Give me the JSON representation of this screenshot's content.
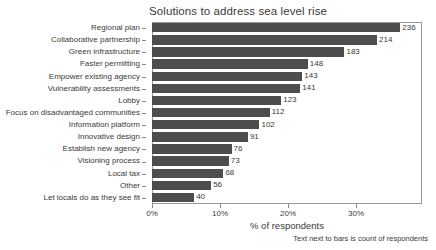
{
  "chart_data": {
    "type": "bar",
    "orientation": "horizontal",
    "title": "Solutions to address sea level rise",
    "xlabel": "% of respondents",
    "ylabel": "",
    "footnote": "Text next to bars is count of respondents",
    "xlim": [
      0,
      39.7
    ],
    "xticks": [
      0,
      10,
      20,
      30
    ],
    "xtick_labels": [
      "0%",
      "10%",
      "20%",
      "30%"
    ],
    "grid": false,
    "legend": null,
    "bar_color": "#4d4d4d",
    "frame_color": "#9a9a9a",
    "background": "#ffffff",
    "total_respondents": 647,
    "categories": [
      "Regional plan",
      "Collaborative partnership",
      "Green infrastructure",
      "Faster permitting",
      "Empower existing agency",
      "Vulnerability assessments",
      "Lobby",
      "Focus on disadvantaged communities",
      "Information platform",
      "Innovative design",
      "Establish new agency",
      "Visioning process",
      "Local tax",
      "Other",
      "Let locals do as they see fit"
    ],
    "values": [
      236,
      214,
      183,
      148,
      143,
      141,
      123,
      112,
      102,
      91,
      76,
      73,
      68,
      56,
      40
    ],
    "value_labels": [
      "236",
      "214",
      "183",
      "148",
      "143",
      "141",
      "123",
      "112",
      "102",
      "91",
      "76",
      "73",
      "68",
      "56",
      "40"
    ],
    "percent_values": [
      36.5,
      33.1,
      28.3,
      22.9,
      22.1,
      21.8,
      19.0,
      17.3,
      15.8,
      14.1,
      11.7,
      11.3,
      10.5,
      8.7,
      6.2
    ]
  }
}
